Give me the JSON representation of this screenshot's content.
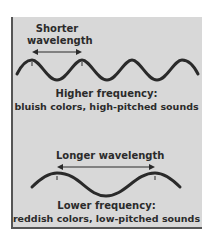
{
  "diagram": {
    "top": {
      "arrow_label_line1": "Shorter",
      "arrow_label_line2": "wavelength",
      "caption_line1": "Higher frequency:",
      "caption_line2": "bluish colors, high-pitched sounds"
    },
    "bottom": {
      "arrow_label": "Longer wavelength",
      "caption_line1": "Lower frequency:",
      "caption_line2": "reddish colors, low-pitched sounds"
    },
    "colors": {
      "panel_bg": "#d8d8d8",
      "wave": "#2a2a2a",
      "text": "#2b2b2b"
    }
  }
}
